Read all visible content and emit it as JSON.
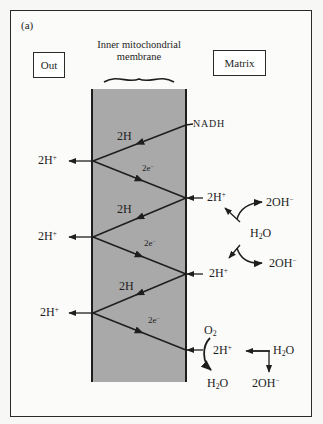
{
  "figure": {
    "panel_label": "(a)",
    "left_compartment": "Out",
    "right_compartment": "Matrix",
    "membrane_title": "Inner mitochondrial membrane",
    "colors": {
      "membrane_fill": "#a9a9a9",
      "line": "#1e1e1e",
      "frame": "#2a2a2a",
      "background": "#fbfbf9"
    }
  },
  "zigzag": {
    "start_label": "NADH",
    "segments": [
      {
        "label": "2H",
        "from": "right",
        "to": "left"
      },
      {
        "label": "2e",
        "from": "left",
        "to": "right"
      },
      {
        "label": "2H",
        "from": "right",
        "to": "left"
      },
      {
        "label": "2e",
        "from": "left",
        "to": "right"
      },
      {
        "label": "2H",
        "from": "right",
        "to": "left"
      },
      {
        "label": "2e",
        "from": "left",
        "to": "right"
      }
    ]
  },
  "protons_out": [
    {
      "base": "2H",
      "charge": "+"
    },
    {
      "base": "2H",
      "charge": "+"
    },
    {
      "base": "2H",
      "charge": "+"
    }
  ],
  "protons_in": [
    {
      "base": "2H",
      "charge": "+"
    },
    {
      "base": "2H",
      "charge": "+"
    },
    {
      "base": "2H",
      "charge": "+"
    }
  ],
  "matrix_reactions": {
    "water_dissociation": {
      "water": {
        "a": "H",
        "sub": "2",
        "b": "O"
      },
      "hydroxide_top": {
        "base": "2OH",
        "charge": "−"
      },
      "hydroxide_bottom": {
        "base": "2OH",
        "charge": "−"
      }
    },
    "oxygen_reduction": {
      "oxygen": {
        "a": "O",
        "sub": "2"
      },
      "product_water": {
        "a": "H",
        "sub": "2",
        "b": "O"
      },
      "source_water": {
        "a": "H",
        "sub": "2",
        "b": "O"
      },
      "hydroxide": {
        "base": "2OH",
        "charge": "−"
      }
    }
  },
  "electron": {
    "base": "2e",
    "charge": "−"
  }
}
